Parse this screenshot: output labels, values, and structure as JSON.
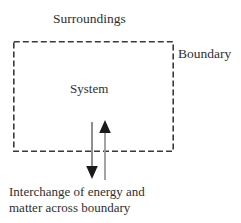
{
  "figure": {
    "type": "thermodynamic-system-diagram",
    "background_color": "#ffffff",
    "ink_color": "#2f2f2f",
    "width": 241,
    "height": 223
  },
  "labels": {
    "surroundings": "Surroundings",
    "boundary": "Boundary",
    "system": "System"
  },
  "caption": {
    "line1": "Interchange of energy and",
    "line2": "matter across boundary"
  },
  "boundary_box": {
    "style": "dashed",
    "stroke_color": "#3a3a3a",
    "dash_length": 6,
    "dash_gap": 3,
    "stroke_width": 1.6,
    "x": 13,
    "y": 41,
    "width": 161,
    "height": 111
  },
  "arrows": [
    {
      "name": "outflow-arrow",
      "direction": "down",
      "meaning": "energy and matter leaving the system",
      "x": 92,
      "y_start": 122,
      "y_end": 178,
      "color": "#5a5a5a",
      "head_color": "#1a1a1a"
    },
    {
      "name": "inflow-arrow",
      "direction": "up",
      "meaning": "energy and matter entering the system",
      "x": 105,
      "y_start": 180,
      "y_end": 121,
      "color": "#8a8a8a",
      "head_color": "#1a1a1a"
    }
  ]
}
